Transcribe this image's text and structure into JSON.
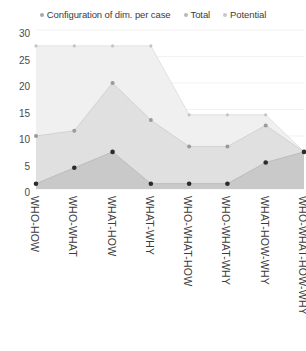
{
  "chart_data": {
    "type": "area",
    "title": "",
    "subtitle": "",
    "xlabel": "",
    "ylabel": "",
    "ylim": [
      0,
      30
    ],
    "y_ticks": [
      0,
      5,
      10,
      15,
      20,
      25,
      30
    ],
    "grid": true,
    "legend_position": "top",
    "categories": [
      "WHO-HOW",
      "WHO-WHAT",
      "WHAT-HOW",
      "WHAT-WHY",
      "WHO-WHAT-HOW",
      "WHO-WHAT-WHY",
      "WHAT-HOW-WHY",
      "WHO-WHAT-HOW-WHY"
    ],
    "series": [
      {
        "name": "Configuration of dim. per case",
        "color": "#c9c9c9",
        "values": [
          1,
          4,
          7,
          1,
          1,
          1,
          5,
          7
        ]
      },
      {
        "name": "Total",
        "color": "#e0e0e0",
        "values": [
          10,
          11,
          20,
          13,
          8,
          8,
          12,
          7
        ]
      },
      {
        "name": "Potential",
        "color": "#f0f0f0",
        "values": [
          27,
          27,
          27,
          27,
          14,
          14,
          14,
          7
        ]
      }
    ]
  },
  "legend": {
    "items": [
      {
        "label": "Configuration of dim. per case",
        "marker_color": "#a8a8a8"
      },
      {
        "label": "Total",
        "marker_color": "#b8b8b8"
      },
      {
        "label": "Potential",
        "marker_color": "#c8c8c8"
      }
    ]
  },
  "axis": {
    "y_ticks": [
      "30",
      "25",
      "20",
      "15",
      "10",
      "5",
      "0"
    ],
    "x_ticks": [
      "WHO-HOW",
      "WHO-WHAT",
      "WHAT-HOW",
      "WHAT-WHY",
      "WHO-WHAT-HOW",
      "WHO-WHAT-WHY",
      "WHAT-HOW-WHY",
      "WHO-WHAT-HOW-WHY"
    ]
  },
  "colors": {
    "background": "#ffffff",
    "gridline": "#f2f2f2",
    "marker_dark": "#2b2b2b",
    "marker_mid": "#9a9a9a",
    "marker_light": "#c4c4c4",
    "text": "#3c3c3c"
  }
}
